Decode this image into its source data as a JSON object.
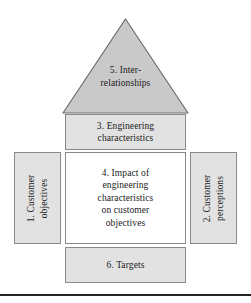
{
  "diagram": {
    "name": "House of Quality",
    "colors": {
      "roof_fill": "#c9c9c9",
      "box_fill_gray": "#e2e2e2",
      "box_fill_white": "#ffffff",
      "border": "#8a8a8a",
      "rule": "#242424",
      "text": "#1a1a1a",
      "background": "#ffffff"
    },
    "roof": {
      "number": "5.",
      "line1": "5. Inter-",
      "line2": "relationships",
      "full_label": "5. Inter-relationships"
    },
    "engineering": {
      "line1": "3. Engineering",
      "line2": "characteristics",
      "full_label": "3. Engineering characteristics"
    },
    "left": {
      "line1": "1. Customer",
      "line2": "objectives",
      "full_label": "1. Customer objectives"
    },
    "center": {
      "line1": "4. Impact of",
      "line2": "engineering",
      "line3": "characteristics",
      "line4": "on customer",
      "line5": "objectives",
      "full_label": "4. Impact of engineering characteristics on customer objectives"
    },
    "right": {
      "line1": "2. Customer",
      "line2": "perceptions",
      "full_label": "2. Customer perceptions"
    },
    "bottom": {
      "label": "6. Targets"
    }
  }
}
